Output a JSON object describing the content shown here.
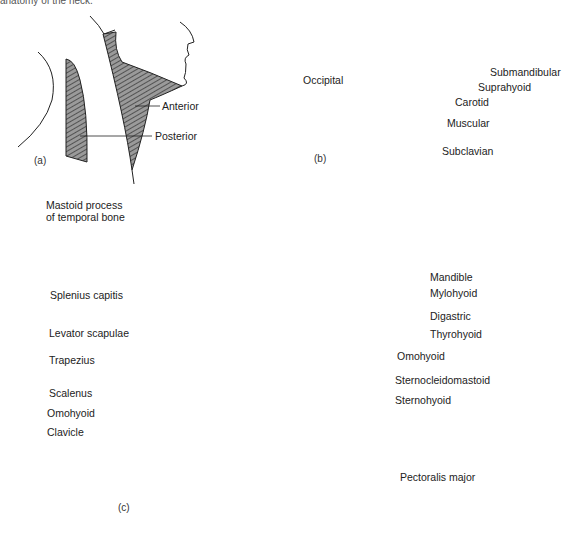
{
  "caption": "anatomy of the neck.",
  "panels": {
    "a": {
      "tag": "(a)",
      "title": "Triangles of the neck",
      "labels": [
        "Anterior",
        "Posterior"
      ]
    },
    "b": {
      "tag": "(b)",
      "title": "Subdivisions of triangles",
      "labels": [
        "Occipital",
        "Submandibular",
        "Suprahyoid",
        "Carotid",
        "Muscular",
        "Subclavian"
      ]
    },
    "c": {
      "tag": "(c)",
      "title": "Muscles of the neck",
      "left_labels": [
        "Mastoid process\nof temporal bone",
        "Splenius capitis",
        "Levator scapulae",
        "Trapezius",
        "Scalenus",
        "Omohyoid",
        "Clavicle"
      ],
      "right_labels": [
        "Mandible",
        "Mylohyoid",
        "Digastric",
        "Thyrohyoid",
        "Omohyoid",
        "Sternocleidomastoid",
        "Sternohyoid",
        "Pectoralis major"
      ]
    }
  },
  "colors": {
    "ink": "#222222",
    "hatch_fill": "#8a8a8a",
    "background": "#ffffff"
  }
}
